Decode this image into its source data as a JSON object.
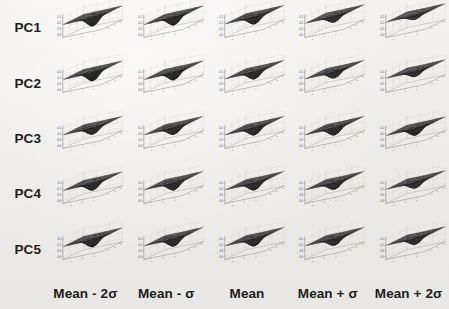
{
  "figure": {
    "background_color": "#efeeea",
    "surface_color": "#2b2b2b",
    "axis_color": "#6e6e6e",
    "grid_color": "#bdbdbd",
    "text_color": "#1d1d1d"
  },
  "rows": [
    {
      "label": "PC1"
    },
    {
      "label": "PC2"
    },
    {
      "label": "PC3"
    },
    {
      "label": "PC4"
    },
    {
      "label": "PC5"
    }
  ],
  "columns": [
    {
      "label": "Mean - 2σ"
    },
    {
      "label": "Mean - σ"
    },
    {
      "label": "Mean"
    },
    {
      "label": "Mean + σ"
    },
    {
      "label": "Mean + 2σ"
    }
  ],
  "axes": {
    "z_ticks": [
      "-0.4",
      "-0.3",
      "-0.2",
      "-0.1"
    ],
    "x_ticks": [
      "0",
      "-1",
      "1"
    ],
    "y_ticks": [
      "-1",
      "0",
      "1"
    ],
    "zlim": [
      -0.45,
      -0.05
    ],
    "grid": true
  },
  "chart_data": {
    "type": "surface",
    "title": "",
    "xlabel": "",
    "ylabel": "",
    "zlabel": "",
    "grid": true,
    "legend": "none",
    "layout": {
      "rows": 5,
      "cols": 5,
      "row_labels_left": true,
      "col_labels_bottom": true
    },
    "zlim": [
      -0.45,
      -0.05
    ],
    "z_ticks": [
      -0.4,
      -0.3,
      -0.2,
      -0.1
    ],
    "panels": [
      {
        "row": "PC1",
        "col": "Mean - 2σ",
        "depth": 0.97,
        "plateau_z": -0.22,
        "min_z": -0.42,
        "funnel_cx": 0.5,
        "funnel_cy": 0.52,
        "funnel_width": 0.3
      },
      {
        "row": "PC1",
        "col": "Mean - σ",
        "depth": 0.93,
        "plateau_z": -0.22,
        "min_z": -0.41,
        "funnel_cx": 0.5,
        "funnel_cy": 0.52,
        "funnel_width": 0.3
      },
      {
        "row": "PC1",
        "col": "Mean",
        "depth": 0.88,
        "plateau_z": -0.21,
        "min_z": -0.4,
        "funnel_cx": 0.49,
        "funnel_cy": 0.52,
        "funnel_width": 0.31
      },
      {
        "row": "PC1",
        "col": "Mean + σ",
        "depth": 0.8,
        "plateau_z": -0.2,
        "min_z": -0.38,
        "funnel_cx": 0.48,
        "funnel_cy": 0.52,
        "funnel_width": 0.32
      },
      {
        "row": "PC1",
        "col": "Mean + 2σ",
        "depth": 0.68,
        "plateau_z": -0.18,
        "min_z": -0.35,
        "funnel_cx": 0.47,
        "funnel_cy": 0.53,
        "funnel_width": 0.34
      },
      {
        "row": "PC2",
        "col": "Mean - 2σ",
        "depth": 0.95,
        "plateau_z": -0.22,
        "min_z": -0.42,
        "funnel_cx": 0.5,
        "funnel_cy": 0.52,
        "funnel_width": 0.3
      },
      {
        "row": "PC2",
        "col": "Mean - σ",
        "depth": 0.92,
        "plateau_z": -0.22,
        "min_z": -0.41,
        "funnel_cx": 0.5,
        "funnel_cy": 0.52,
        "funnel_width": 0.3
      },
      {
        "row": "PC2",
        "col": "Mean",
        "depth": 0.88,
        "plateau_z": -0.21,
        "min_z": -0.4,
        "funnel_cx": 0.49,
        "funnel_cy": 0.52,
        "funnel_width": 0.31
      },
      {
        "row": "PC2",
        "col": "Mean + σ",
        "depth": 0.84,
        "plateau_z": -0.21,
        "min_z": -0.39,
        "funnel_cx": 0.49,
        "funnel_cy": 0.52,
        "funnel_width": 0.31
      },
      {
        "row": "PC2",
        "col": "Mean + 2σ",
        "depth": 0.78,
        "plateau_z": -0.2,
        "min_z": -0.37,
        "funnel_cx": 0.48,
        "funnel_cy": 0.53,
        "funnel_width": 0.33
      },
      {
        "row": "PC3",
        "col": "Mean - 2σ",
        "depth": 0.86,
        "plateau_z": -0.21,
        "min_z": -0.39,
        "funnel_cx": 0.5,
        "funnel_cy": 0.52,
        "funnel_width": 0.32
      },
      {
        "row": "PC3",
        "col": "Mean - σ",
        "depth": 0.87,
        "plateau_z": -0.21,
        "min_z": -0.39,
        "funnel_cx": 0.5,
        "funnel_cy": 0.52,
        "funnel_width": 0.32
      },
      {
        "row": "PC3",
        "col": "Mean",
        "depth": 0.88,
        "plateau_z": -0.21,
        "min_z": -0.4,
        "funnel_cx": 0.49,
        "funnel_cy": 0.52,
        "funnel_width": 0.31
      },
      {
        "row": "PC3",
        "col": "Mean + σ",
        "depth": 0.89,
        "plateau_z": -0.21,
        "min_z": -0.4,
        "funnel_cx": 0.49,
        "funnel_cy": 0.52,
        "funnel_width": 0.31
      },
      {
        "row": "PC3",
        "col": "Mean + 2σ",
        "depth": 0.9,
        "plateau_z": -0.22,
        "min_z": -0.4,
        "funnel_cx": 0.49,
        "funnel_cy": 0.52,
        "funnel_width": 0.31
      },
      {
        "row": "PC4",
        "col": "Mean - 2σ",
        "depth": 0.9,
        "plateau_z": -0.22,
        "min_z": -0.4,
        "funnel_cx": 0.5,
        "funnel_cy": 0.52,
        "funnel_width": 0.31
      },
      {
        "row": "PC4",
        "col": "Mean - σ",
        "depth": 0.89,
        "plateau_z": -0.21,
        "min_z": -0.4,
        "funnel_cx": 0.5,
        "funnel_cy": 0.52,
        "funnel_width": 0.31
      },
      {
        "row": "PC4",
        "col": "Mean",
        "depth": 0.88,
        "plateau_z": -0.21,
        "min_z": -0.4,
        "funnel_cx": 0.49,
        "funnel_cy": 0.52,
        "funnel_width": 0.31
      },
      {
        "row": "PC4",
        "col": "Mean + σ",
        "depth": 0.86,
        "plateau_z": -0.21,
        "min_z": -0.39,
        "funnel_cx": 0.49,
        "funnel_cy": 0.52,
        "funnel_width": 0.32
      },
      {
        "row": "PC4",
        "col": "Mean + 2σ",
        "depth": 0.8,
        "plateau_z": -0.2,
        "min_z": -0.38,
        "funnel_cx": 0.48,
        "funnel_cy": 0.53,
        "funnel_width": 0.33
      },
      {
        "row": "PC5",
        "col": "Mean - 2σ",
        "depth": 0.91,
        "plateau_z": -0.22,
        "min_z": -0.41,
        "funnel_cx": 0.5,
        "funnel_cy": 0.52,
        "funnel_width": 0.31
      },
      {
        "row": "PC5",
        "col": "Mean - σ",
        "depth": 0.9,
        "plateau_z": -0.21,
        "min_z": -0.4,
        "funnel_cx": 0.5,
        "funnel_cy": 0.52,
        "funnel_width": 0.31
      },
      {
        "row": "PC5",
        "col": "Mean",
        "depth": 0.88,
        "plateau_z": -0.21,
        "min_z": -0.4,
        "funnel_cx": 0.49,
        "funnel_cy": 0.52,
        "funnel_width": 0.31
      },
      {
        "row": "PC5",
        "col": "Mean + σ",
        "depth": 0.86,
        "plateau_z": -0.21,
        "min_z": -0.39,
        "funnel_cx": 0.49,
        "funnel_cy": 0.52,
        "funnel_width": 0.32
      },
      {
        "row": "PC5",
        "col": "Mean + 2σ",
        "depth": 0.82,
        "plateau_z": -0.2,
        "min_z": -0.38,
        "funnel_cx": 0.48,
        "funnel_cy": 0.53,
        "funnel_width": 0.33
      }
    ]
  }
}
